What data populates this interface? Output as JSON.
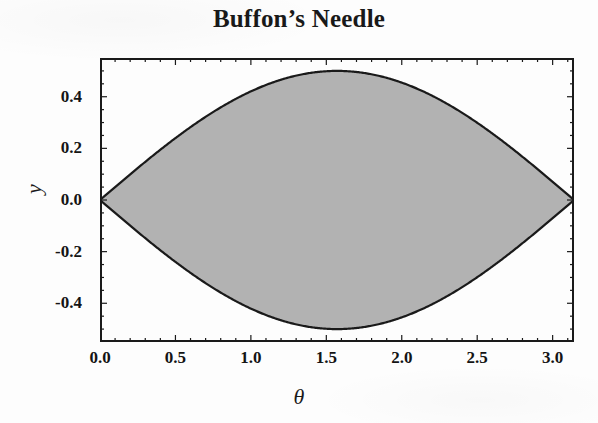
{
  "chart_data": {
    "type": "area",
    "title": "Buffon’s Needle",
    "xlabel": "θ",
    "ylabel": "y",
    "xlim": [
      0,
      3.14159265
    ],
    "ylim": [
      -0.55,
      0.55
    ],
    "grid": false,
    "legend": null,
    "xticks": [
      "0.0",
      "0.5",
      "1.0",
      "1.5",
      "2.0",
      "2.5",
      "3.0"
    ],
    "xtick_values": [
      0.0,
      0.5,
      1.0,
      1.5,
      2.0,
      2.5,
      3.0
    ],
    "yticks": [
      "0.4",
      "0.2",
      "0.0",
      "-0.2",
      "-0.4"
    ],
    "ytick_values": [
      0.4,
      0.2,
      0.0,
      -0.2,
      -0.4
    ],
    "x_minor_step": 0.1,
    "y_minor_step": 0.05,
    "series": [
      {
        "name": "upper boundary",
        "expression": "y = 0.5*sin(theta)",
        "x": [
          0.0,
          0.15708,
          0.31416,
          0.47124,
          0.62832,
          0.7854,
          0.94248,
          1.09956,
          1.25664,
          1.41372,
          1.5708,
          1.72788,
          1.88496,
          2.04204,
          2.19911,
          2.35619,
          2.51327,
          2.67035,
          2.82743,
          2.98451,
          3.14159
        ],
        "y": [
          0.0,
          0.07822,
          0.15451,
          0.227,
          0.29389,
          0.35355,
          0.40451,
          0.4455,
          0.47553,
          0.49384,
          0.5,
          0.49384,
          0.47553,
          0.4455,
          0.40451,
          0.35355,
          0.29389,
          0.227,
          0.15451,
          0.07822,
          0.0
        ]
      },
      {
        "name": "lower boundary",
        "expression": "y = -0.5*sin(theta)",
        "x": [
          0.0,
          0.15708,
          0.31416,
          0.47124,
          0.62832,
          0.7854,
          0.94248,
          1.09956,
          1.25664,
          1.41372,
          1.5708,
          1.72788,
          1.88496,
          2.04204,
          2.19911,
          2.35619,
          2.51327,
          2.67035,
          2.82743,
          2.98451,
          3.14159
        ],
        "y": [
          0.0,
          -0.07822,
          -0.15451,
          -0.227,
          -0.29389,
          -0.35355,
          -0.40451,
          -0.4455,
          -0.47553,
          -0.49384,
          -0.5,
          -0.49384,
          -0.47553,
          -0.4455,
          -0.40451,
          -0.35355,
          -0.29389,
          -0.227,
          -0.15451,
          -0.07822,
          0.0
        ]
      }
    ],
    "fill_between": {
      "label": "shaded region between curves",
      "fill_color": "#b2b2b2",
      "edge_color": "#1a1a1a"
    },
    "frame_color": "#1a1a1a",
    "background_color": "#fdfdfd"
  }
}
